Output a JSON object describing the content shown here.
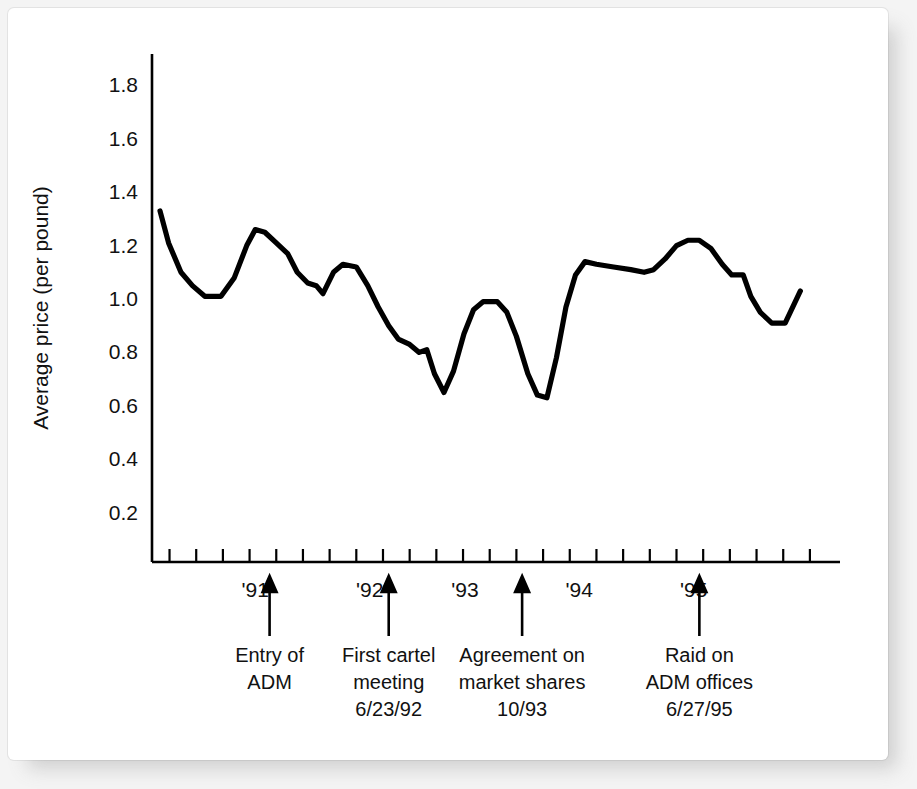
{
  "chart_data": {
    "type": "line",
    "title": "",
    "xlabel": "",
    "ylabel": "Average price (per pound)",
    "ylim": [
      0,
      1.9
    ],
    "ytick_values": [
      0.2,
      0.4,
      0.6,
      0.8,
      1.0,
      1.2,
      1.4,
      1.6,
      1.8
    ],
    "ytick_labels": [
      "0.2",
      "0.4",
      "0.6",
      "0.8",
      "1.0",
      "1.2",
      "1.4",
      "1.6",
      "1.8"
    ],
    "xtick_labels": [
      "'91",
      "'92",
      "'93",
      "'94",
      "'95"
    ],
    "xtick_positions": [
      5.0,
      11.0,
      16.0,
      22.0,
      28.0
    ],
    "grid": false,
    "legend": false,
    "x": [
      0,
      1,
      2,
      3,
      4,
      5,
      6,
      7,
      8,
      9,
      10,
      11,
      12,
      13,
      14,
      15,
      16,
      17,
      18,
      19,
      20,
      21,
      22,
      23,
      24,
      25,
      26,
      27,
      28,
      29,
      30,
      31,
      32,
      33,
      34,
      35,
      36,
      37,
      38,
      39,
      40,
      41,
      42,
      43,
      44,
      45,
      46,
      47,
      48
    ],
    "values": [
      1.33,
      1.21,
      1.1,
      1.05,
      1.01,
      1.01,
      1.08,
      1.2,
      1.26,
      1.25,
      1.21,
      1.17,
      1.1,
      1.06,
      1.05,
      1.02,
      1.1,
      1.13,
      1.12,
      1.05,
      0.97,
      0.9,
      0.85,
      0.83,
      0.8,
      0.81,
      0.72,
      0.65,
      0.73,
      0.87,
      0.96,
      0.99,
      0.99,
      0.95,
      0.86,
      0.72,
      0.64,
      0.63,
      0.78,
      0.97,
      1.09,
      1.14,
      1.13,
      1.12,
      1.11,
      1.1,
      1.11,
      1.15,
      1.2
    ],
    "values_tail": [
      1.22,
      1.22,
      1.19,
      1.13,
      1.09,
      1.09,
      1.01,
      0.95,
      0.91,
      0.91,
      1.03
    ],
    "series": [
      {
        "name": "Average price (per pound)",
        "points": [
          [
            0.0,
            1.33
          ],
          [
            0.45,
            1.21
          ],
          [
            1.1,
            1.1
          ],
          [
            1.7,
            1.05
          ],
          [
            2.35,
            1.01
          ],
          [
            3.2,
            1.01
          ],
          [
            3.9,
            1.08
          ],
          [
            4.55,
            1.2
          ],
          [
            5.0,
            1.26
          ],
          [
            5.5,
            1.25
          ],
          [
            6.1,
            1.21
          ],
          [
            6.7,
            1.17
          ],
          [
            7.2,
            1.1
          ],
          [
            7.75,
            1.06
          ],
          [
            8.2,
            1.05
          ],
          [
            8.55,
            1.02
          ],
          [
            9.1,
            1.1
          ],
          [
            9.6,
            1.13
          ],
          [
            10.3,
            1.12
          ],
          [
            10.9,
            1.05
          ],
          [
            11.45,
            0.97
          ],
          [
            12.0,
            0.9
          ],
          [
            12.5,
            0.85
          ],
          [
            13.1,
            0.83
          ],
          [
            13.6,
            0.8
          ],
          [
            14.0,
            0.81
          ],
          [
            14.4,
            0.72
          ],
          [
            14.9,
            0.65
          ],
          [
            15.4,
            0.73
          ],
          [
            15.95,
            0.87
          ],
          [
            16.45,
            0.96
          ],
          [
            16.95,
            0.99
          ],
          [
            17.7,
            0.99
          ],
          [
            18.2,
            0.95
          ],
          [
            18.7,
            0.86
          ],
          [
            19.3,
            0.72
          ],
          [
            19.8,
            0.64
          ],
          [
            20.3,
            0.63
          ],
          [
            20.8,
            0.78
          ],
          [
            21.3,
            0.97
          ],
          [
            21.8,
            1.09
          ],
          [
            22.3,
            1.14
          ],
          [
            22.9,
            1.13
          ],
          [
            23.8,
            1.12
          ],
          [
            24.7,
            1.11
          ],
          [
            25.4,
            1.1
          ],
          [
            25.9,
            1.11
          ],
          [
            26.5,
            1.15
          ],
          [
            27.1,
            1.2
          ],
          [
            27.7,
            1.22
          ],
          [
            28.3,
            1.22
          ],
          [
            28.9,
            1.19
          ],
          [
            29.5,
            1.13
          ],
          [
            30.0,
            1.09
          ],
          [
            30.6,
            1.09
          ],
          [
            31.0,
            1.01
          ],
          [
            31.5,
            0.95
          ],
          [
            32.1,
            0.91
          ],
          [
            32.8,
            0.91
          ],
          [
            33.6,
            1.03
          ]
        ]
      }
    ],
    "annotations": [
      {
        "lines": [
          "Entry of",
          "ADM"
        ],
        "x_position": 5.75,
        "arrow": true
      },
      {
        "lines": [
          "First cartel",
          "meeting",
          "6/23/92"
        ],
        "x_position": 12.0,
        "arrow": true
      },
      {
        "lines": [
          "Agreement on",
          "market shares",
          "10/93"
        ],
        "x_position": 19.0,
        "arrow": true
      },
      {
        "lines": [
          "Raid on",
          "ADM offices",
          "6/27/95"
        ],
        "x_position": 28.3,
        "arrow": true
      }
    ],
    "x_axis_tick_count": 25,
    "x_axis_tick_start": 0.5,
    "x_axis_tick_step": 1.4
  }
}
